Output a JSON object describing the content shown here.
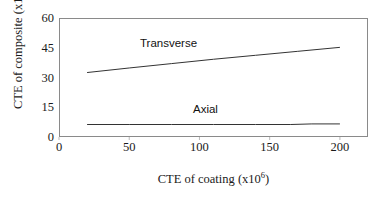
{
  "chart_data": {
    "type": "line",
    "title": "",
    "xlabel": "CTE of coating (x10⁶)",
    "ylabel": "CTE of composite (x10⁶)",
    "xlabel_base": "CTE of coating (x10",
    "xlabel_exp": "6",
    "xlabel_tail": ")",
    "ylabel_base": "CTE of composite (x10",
    "ylabel_exp": "6",
    "ylabel_tail": ")",
    "xlim": [
      0,
      220
    ],
    "ylim": [
      0,
      60
    ],
    "xticks": [
      0,
      50,
      100,
      150,
      200
    ],
    "yticks": [
      0,
      15,
      30,
      45,
      60
    ],
    "xtick_labels": [
      "0",
      "50",
      "100",
      "150",
      "200"
    ],
    "ytick_labels": [
      "0",
      "15",
      "30",
      "45",
      "60"
    ],
    "grid": false,
    "legend": "inline-labels",
    "frame": true,
    "line_color": "#333333",
    "frame_color": "#8a8a8a",
    "background": "#ffffff",
    "series": [
      {
        "name": "Transverse",
        "label_x": 110,
        "label_y": 50,
        "x": [
          20,
          50,
          80,
          110,
          140,
          170,
          200
        ],
        "values": [
          32.5,
          34.8,
          37.0,
          39.2,
          41.2,
          43.2,
          45.2
        ]
      },
      {
        "name": "Axial",
        "label_x": 125,
        "label_y": 12,
        "x": [
          20,
          50,
          80,
          110,
          140,
          165,
          180,
          200
        ],
        "values": [
          6.3,
          6.3,
          6.3,
          6.3,
          6.3,
          6.3,
          6.6,
          6.6
        ]
      }
    ]
  }
}
